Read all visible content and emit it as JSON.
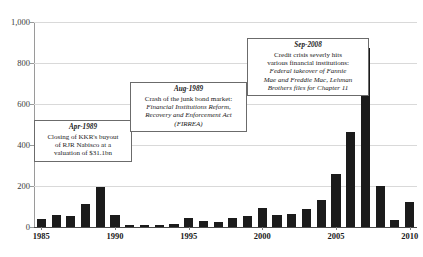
{
  "chart_data": {
    "type": "bar",
    "title": "",
    "xlabel": "",
    "ylabel": "",
    "ylim": [
      0,
      1000
    ],
    "grid": true,
    "legend": null,
    "categories": [
      "1985",
      "1986",
      "1987",
      "1988",
      "1989",
      "1990",
      "1991",
      "1992",
      "1993",
      "1994",
      "1995",
      "1996",
      "1997",
      "1998",
      "1999",
      "2000",
      "2001",
      "2002",
      "2003",
      "2004",
      "2005",
      "2006",
      "2007",
      "2008",
      "2009",
      "2010"
    ],
    "values": [
      38,
      57,
      56,
      114,
      196,
      60,
      11,
      12,
      11,
      13,
      42,
      30,
      24,
      45,
      56,
      92,
      60,
      64,
      86,
      131,
      260,
      465,
      873,
      200,
      32,
      120
    ],
    "ytick_labels": [
      "0",
      "200",
      "400",
      "600",
      "800",
      "1,000"
    ],
    "ytick_values": [
      0,
      200,
      400,
      600,
      800,
      1000
    ],
    "xtick_labels": [
      "1985",
      "1990",
      "1995",
      "2000",
      "2005",
      "2010"
    ],
    "xtick_categories": [
      "1985",
      "1990",
      "1995",
      "2000",
      "2005",
      "2010"
    ],
    "bar_color": "#1b1b1b",
    "gridline_color": "#d9d9d9",
    "annotations": [
      {
        "id": "apr-1989",
        "date": "Apr-1989",
        "lines": [
          {
            "text": "Closing of KKR's buyout",
            "italic": false
          },
          {
            "text": "of RJR Nabisco at a",
            "italic": false
          },
          {
            "text": "valuation of $31.1bn",
            "italic": false
          }
        ]
      },
      {
        "id": "aug-1989",
        "date": "Aug-1989",
        "lines": [
          {
            "text": "Crash of the junk bond market:",
            "italic": false
          },
          {
            "text": "Financial Institutions Reform,",
            "italic": true
          },
          {
            "text": "Recovery and Enforcement Act",
            "italic": true
          },
          {
            "text": "(FIRREA)",
            "italic": true
          }
        ]
      },
      {
        "id": "sep-2008",
        "date": "Sep-2008",
        "lines": [
          {
            "text": "Credit crisis severly hits",
            "italic": false
          },
          {
            "text": "various financial institutions:",
            "italic": false
          },
          {
            "text": "Federal takeover of Fannie",
            "italic": true
          },
          {
            "text": "Mae and Freddie Mac, Lehman",
            "italic": true
          },
          {
            "text": "Brothers files for Chapter 11",
            "italic": true
          }
        ]
      }
    ]
  }
}
